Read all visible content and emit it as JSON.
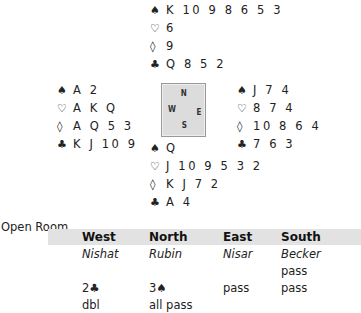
{
  "deal": {
    "north": {
      "spades": "K 10 9 8 6 5 3",
      "hearts": "6",
      "diamonds": "9",
      "clubs": "Q 8 5 2"
    },
    "west": {
      "spades": "A 2",
      "hearts": "A K Q",
      "diamonds": "A Q 5 3",
      "clubs": "K J 10 9"
    },
    "east": {
      "spades": "J 7 4",
      "hearts": "8 7 4",
      "diamonds": "10 8 6 4",
      "clubs": "7 6 3"
    },
    "south": {
      "spades": "Q",
      "hearts": "J 10 9 5 3 2",
      "diamonds": "K J 7 2",
      "clubs": "A 4"
    }
  },
  "suits": {
    "spade": "♠",
    "heart": "♡",
    "diamond": "◊",
    "club": "♣"
  },
  "compass": {
    "n": "N",
    "s": "S",
    "w": "W",
    "e": "E"
  },
  "room_title": "Open Room",
  "bidding": {
    "headers": [
      "West",
      "North",
      "East",
      "South"
    ],
    "players": [
      "Nishat",
      "Rubin",
      "Nisar",
      "Becker"
    ],
    "rounds": [
      [
        "",
        "",
        "",
        "pass"
      ],
      [
        "2♣",
        "3♠",
        "pass",
        "pass"
      ],
      [
        "dbl",
        "all pass",
        "",
        ""
      ]
    ]
  }
}
